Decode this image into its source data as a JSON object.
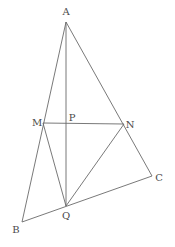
{
  "diagram": {
    "type": "geometry-figure",
    "stroke_color": "#6a6a6a",
    "label_color": "#4a4a4a",
    "points": {
      "A": {
        "label": "A",
        "x": 66,
        "y": 22,
        "lx": 66,
        "ly": 15
      },
      "M": {
        "label": "M",
        "x": 43,
        "y": 123,
        "lx": 37,
        "ly": 126
      },
      "P": {
        "label": "P",
        "x": 66,
        "y": 123,
        "lx": 72,
        "ly": 121
      },
      "N": {
        "label": "N",
        "x": 124,
        "y": 124,
        "lx": 130,
        "ly": 128
      },
      "C": {
        "label": "C",
        "x": 152,
        "y": 176,
        "lx": 159,
        "ly": 181
      },
      "Q": {
        "label": "Q",
        "x": 66,
        "y": 206,
        "lx": 66,
        "ly": 219
      },
      "B": {
        "label": "B",
        "x": 22,
        "y": 222,
        "lx": 16,
        "ly": 233
      }
    },
    "segments": [
      [
        "A",
        "B"
      ],
      [
        "A",
        "C"
      ],
      [
        "B",
        "C"
      ],
      [
        "A",
        "Q"
      ],
      [
        "M",
        "N"
      ],
      [
        "M",
        "Q"
      ],
      [
        "N",
        "Q"
      ]
    ]
  }
}
